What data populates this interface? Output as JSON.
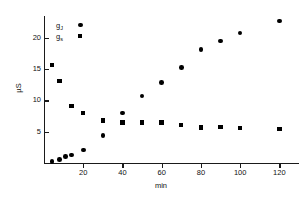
{
  "chart_data": {
    "type": "scatter",
    "title": "",
    "xlabel": "min",
    "ylabel": "µS",
    "xlim": [
      0,
      130
    ],
    "ylim": [
      0,
      23.5
    ],
    "xticks": [
      20,
      40,
      60,
      80,
      100,
      120
    ],
    "yticks": [
      5,
      10,
      15,
      20
    ],
    "grid": false,
    "legend_position": "upper-left-inside",
    "series": [
      {
        "name": "g_J",
        "label": "g",
        "sublabel": "J",
        "marker": "circle",
        "color": "#000000",
        "points": [
          {
            "x": 4,
            "y": 0.2
          },
          {
            "x": 8,
            "y": 0.6
          },
          {
            "x": 11,
            "y": 1.0
          },
          {
            "x": 14,
            "y": 1.3
          },
          {
            "x": 20,
            "y": 2.1
          },
          {
            "x": 30,
            "y": 4.4
          },
          {
            "x": 40,
            "y": 8.0
          },
          {
            "x": 50,
            "y": 10.7
          },
          {
            "x": 60,
            "y": 12.9
          },
          {
            "x": 70,
            "y": 15.3
          },
          {
            "x": 80,
            "y": 18.1
          },
          {
            "x": 90,
            "y": 19.5
          },
          {
            "x": 100,
            "y": 20.8
          },
          {
            "x": 120,
            "y": 22.7
          }
        ]
      },
      {
        "name": "g_s",
        "label": "g",
        "sublabel": "s",
        "marker": "square",
        "color": "#000000",
        "points": [
          {
            "x": 4,
            "y": 15.7
          },
          {
            "x": 8,
            "y": 13.1
          },
          {
            "x": 14,
            "y": 9.1
          },
          {
            "x": 20,
            "y": 8.0
          },
          {
            "x": 30,
            "y": 6.8
          },
          {
            "x": 40,
            "y": 6.5
          },
          {
            "x": 50,
            "y": 6.5
          },
          {
            "x": 60,
            "y": 6.5
          },
          {
            "x": 70,
            "y": 6.1
          },
          {
            "x": 80,
            "y": 5.7
          },
          {
            "x": 90,
            "y": 5.8
          },
          {
            "x": 100,
            "y": 5.6
          },
          {
            "x": 120,
            "y": 5.4
          }
        ]
      }
    ]
  }
}
